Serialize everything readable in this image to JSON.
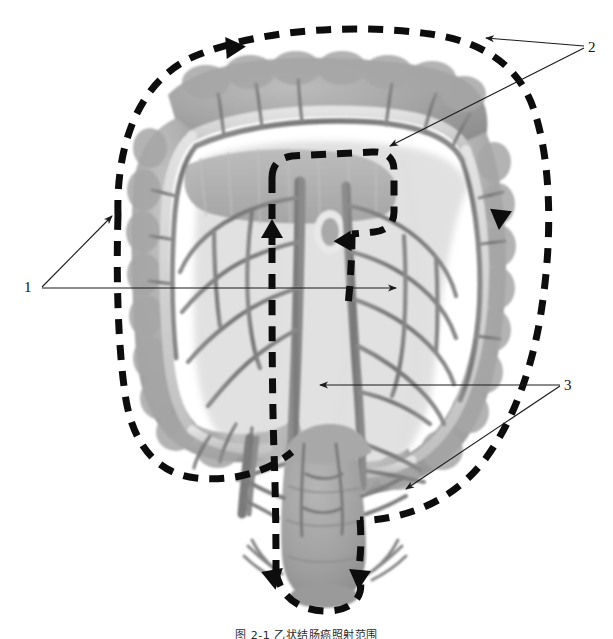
{
  "figure": {
    "caption": "图 2-1  乙状结肠癌照射范围",
    "background_color": "#ffffff",
    "ink_color": "#111111"
  },
  "labels": [
    {
      "id": "1",
      "text": "1",
      "x": 24,
      "y": 280,
      "description": "right and transverse colon resection boundary"
    },
    {
      "id": "2",
      "text": "2",
      "x": 588,
      "y": 40,
      "description": "transverse colon and mesenteric root boundary"
    },
    {
      "id": "3",
      "text": "3",
      "x": 564,
      "y": 378,
      "description": "descending sigmoid and rectum boundary"
    }
  ],
  "leaders": [
    {
      "name": "leader-1-upper",
      "from": [
        40,
        287
      ],
      "to": [
        110,
        215
      ],
      "arrow": true
    },
    {
      "name": "leader-1-lower",
      "from": [
        40,
        287
      ],
      "to": [
        398,
        287
      ],
      "arrow": true
    },
    {
      "name": "leader-2-upper",
      "from": [
        584,
        47
      ],
      "to": [
        482,
        38
      ],
      "arrow": true
    },
    {
      "name": "leader-2-lower",
      "from": [
        584,
        47
      ],
      "to": [
        388,
        146
      ],
      "arrow": true
    },
    {
      "name": "leader-3-upper",
      "from": [
        560,
        385
      ],
      "to": [
        318,
        385
      ],
      "arrow": true
    },
    {
      "name": "leader-3-lower",
      "from": [
        560,
        385
      ],
      "to": [
        405,
        490
      ],
      "arrow": true
    }
  ],
  "tissue": {
    "colon_fill": "#9d9d9d",
    "colon_fill_light": "#b4b4b4",
    "taenia_fill": "#d6d6d6",
    "vessel_fill": "#7e7e7e",
    "vessel_dark": "#6a6a6a",
    "rectum_fill": "#a2a2a2"
  },
  "dashed_paths": {
    "stroke": "#0d0d0d",
    "width": 7,
    "dash": "15 11",
    "zones": [
      {
        "name": "outer-colon-boundary",
        "label_ref": "1"
      },
      {
        "name": "mesenteric-root-boundary",
        "label_ref": "2"
      },
      {
        "name": "rectum-boundary",
        "label_ref": "3"
      }
    ]
  },
  "flow_arrows": [
    {
      "name": "arrow-top-right",
      "x": 232,
      "y": 52,
      "rotation": 0
    },
    {
      "name": "arrow-right-down",
      "x": 505,
      "y": 218,
      "rotation": 95
    },
    {
      "name": "arrow-center-up",
      "x": 276,
      "y": 225,
      "rotation": -90
    },
    {
      "name": "arrow-center-downright",
      "x": 346,
      "y": 225,
      "rotation": 55
    },
    {
      "name": "arrow-rectum-left",
      "x": 276,
      "y": 578,
      "rotation": 90
    },
    {
      "name": "arrow-rectum-right",
      "x": 357,
      "y": 578,
      "rotation": 90
    }
  ]
}
